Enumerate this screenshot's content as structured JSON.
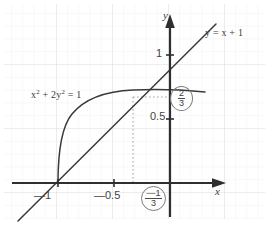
{
  "figure": {
    "kind": "coordinate-plane-graph",
    "background_color": "#ffffff",
    "grid_color": "#eceaea",
    "axis_color": "#2f2f2f",
    "curve_color": "#3a3a3a",
    "guide_color": "#9a9a9a",
    "annotation_circle_color": "#7c7c7c"
  },
  "axes": {
    "x_label": "x",
    "y_label": "y",
    "x_ticks": [
      {
        "label": "—1",
        "value": -1
      },
      {
        "label": "—0.5",
        "value": -0.5
      }
    ],
    "y_ticks": [
      {
        "label": "1",
        "value": 1
      },
      {
        "label": "0.5",
        "value": 0.5
      }
    ]
  },
  "curves": {
    "line": {
      "label": "y = x + 1",
      "equation": "y = x + 1",
      "slope": 1,
      "intercept": 1
    },
    "ellipse": {
      "label_html": "x<sup>2</sup> + 2y<sup>2</sup> = 1",
      "equation": "x^2 + 2y^2 = 1",
      "semi_axis_x": 1,
      "semi_axis_y": 0.7071,
      "branch": "upper"
    }
  },
  "annotations": {
    "intersection_point": {
      "x": -0.3333,
      "y": 0.6667
    },
    "y_value": {
      "numerator": "2",
      "denominator": "3"
    },
    "x_value": {
      "numerator": "—1",
      "denominator": "3"
    }
  },
  "chart_data": {
    "type": "line",
    "title": "",
    "xlabel": "x",
    "ylabel": "y",
    "xlim": [
      -1.35,
      0.6
    ],
    "ylim": [
      -0.25,
      1.3
    ],
    "grid": true,
    "legend": "inline-annotations",
    "series": [
      {
        "name": "y = x + 1",
        "x": [
          -1.35,
          -1.0,
          -0.5,
          -0.3333,
          0.0,
          0.35
        ],
        "values": [
          -0.35,
          0.0,
          0.5,
          0.6667,
          1.0,
          1.35
        ]
      },
      {
        "name": "x^2 + 2y^2 = 1 (upper branch)",
        "x": [
          -1.0,
          -0.95,
          -0.9,
          -0.8,
          -0.7,
          -0.6,
          -0.5,
          -0.3333,
          -0.2,
          0.0,
          0.2,
          0.35
        ],
        "values": [
          0.0,
          0.2207,
          0.3082,
          0.4243,
          0.505,
          0.5657,
          0.6124,
          0.6667,
          0.6928,
          0.7071,
          0.6928,
          0.6614
        ]
      }
    ],
    "points": [
      {
        "name": "intersection",
        "x": -0.3333,
        "y": 0.6667,
        "label_x": "—1/3",
        "label_y": "2/3"
      }
    ]
  }
}
